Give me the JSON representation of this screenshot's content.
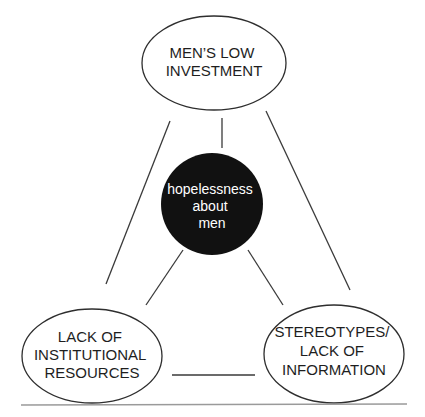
{
  "diagram": {
    "type": "triangle-relationship",
    "center": {
      "lines": [
        "hopelessness",
        "about",
        "men"
      ],
      "fill": "#111111",
      "text_color": "#ffffff"
    },
    "nodes": [
      {
        "id": "top",
        "lines": [
          "MEN’S LOW",
          "INVESTMENT"
        ]
      },
      {
        "id": "bottom-left",
        "lines": [
          "LACK OF",
          "INSTITUTIONAL",
          "RESOURCES"
        ]
      },
      {
        "id": "bottom-right",
        "lines": [
          "STEREOTYPES/",
          "LACK OF",
          "INFORMATION"
        ]
      }
    ],
    "edges": [
      {
        "from": "top",
        "to": "bottom-left"
      },
      {
        "from": "top",
        "to": "bottom-right"
      },
      {
        "from": "bottom-left",
        "to": "bottom-right"
      },
      {
        "from": "top",
        "to": "center"
      },
      {
        "from": "center",
        "to": "bottom-left"
      },
      {
        "from": "center",
        "to": "bottom-right"
      }
    ]
  }
}
